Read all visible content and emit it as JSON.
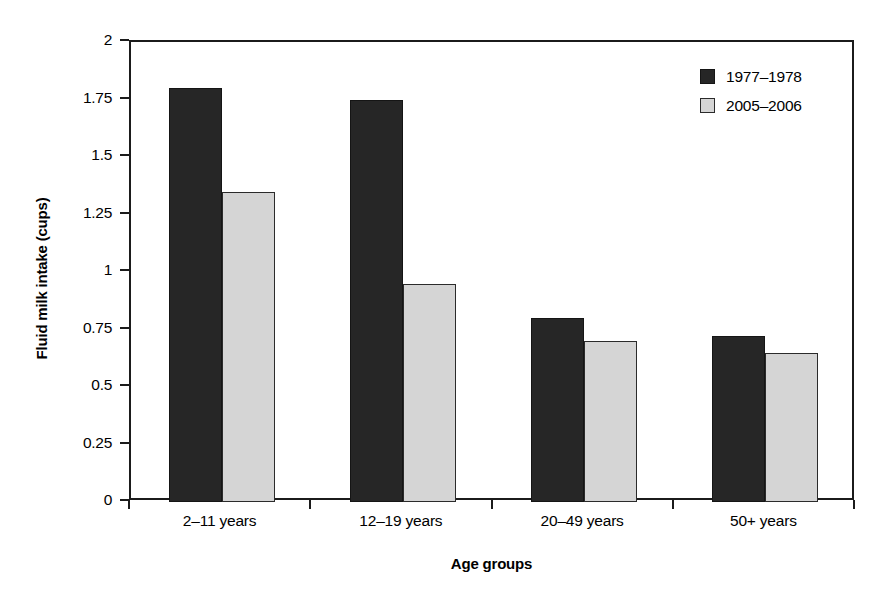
{
  "chart_data": {
    "type": "bar",
    "title": "",
    "xlabel": "Age groups",
    "ylabel": "Fluid milk intake (cups)",
    "categories": [
      "2–11 years",
      "12–19 years",
      "20–49 years",
      "50+ years"
    ],
    "series": [
      {
        "name": "1977–1978",
        "values": [
          1.8,
          1.75,
          0.8,
          0.72
        ],
        "color": "#262626"
      },
      {
        "name": "2005–2006",
        "values": [
          1.35,
          0.95,
          0.7,
          0.65
        ],
        "color": "#d5d5d5"
      }
    ],
    "ylim": [
      0,
      2
    ],
    "ytick_labels": [
      "2",
      "1.75",
      "1.5",
      "1.25",
      "1",
      "0.75",
      "0.5",
      "0.25",
      "0"
    ],
    "ytick_values": [
      2,
      1.75,
      1.5,
      1.25,
      1,
      0.75,
      0.5,
      0.25,
      0
    ],
    "grid": false,
    "legend_position": "top-right"
  },
  "axes": {
    "y_title": "Fluid milk intake (cups)",
    "x_title": "Age groups",
    "y_ticks": [
      {
        "label": "2"
      },
      {
        "label": "1.75"
      },
      {
        "label": "1.5"
      },
      {
        "label": "1.25"
      },
      {
        "label": "1"
      },
      {
        "label": "0.75"
      },
      {
        "label": "0.5"
      },
      {
        "label": "0.25"
      },
      {
        "label": "0"
      }
    ],
    "x_ticks": [
      {
        "label": "2–11 years"
      },
      {
        "label": "12–19 years"
      },
      {
        "label": "20–49 years"
      },
      {
        "label": "50+ years"
      }
    ]
  },
  "legend": {
    "entries": [
      {
        "label": "1977–1978"
      },
      {
        "label": "2005–2006"
      }
    ]
  },
  "colors": {
    "series_a": "#262626",
    "series_b": "#d5d5d5",
    "axis": "#1b1b1b",
    "background": "#ffffff"
  }
}
